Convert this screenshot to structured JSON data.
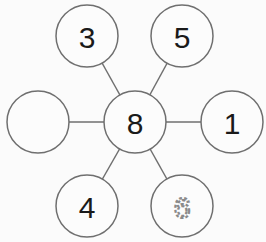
{
  "diagram": {
    "type": "number-bond-star",
    "center": {
      "id": "center",
      "label": "8"
    },
    "nodes": [
      {
        "id": "top-left",
        "label": "3",
        "style": "solid"
      },
      {
        "id": "top-right",
        "label": "5",
        "style": "solid"
      },
      {
        "id": "left",
        "label": "",
        "style": "blank"
      },
      {
        "id": "right",
        "label": "1",
        "style": "solid"
      },
      {
        "id": "bottom-left",
        "label": "4",
        "style": "solid"
      },
      {
        "id": "bottom-right",
        "label": "6",
        "style": "dotted-trace"
      }
    ],
    "colors": {
      "stroke": "#6f6f6f",
      "text": "#1a1a1a",
      "trace": "#8a8a8a"
    }
  }
}
